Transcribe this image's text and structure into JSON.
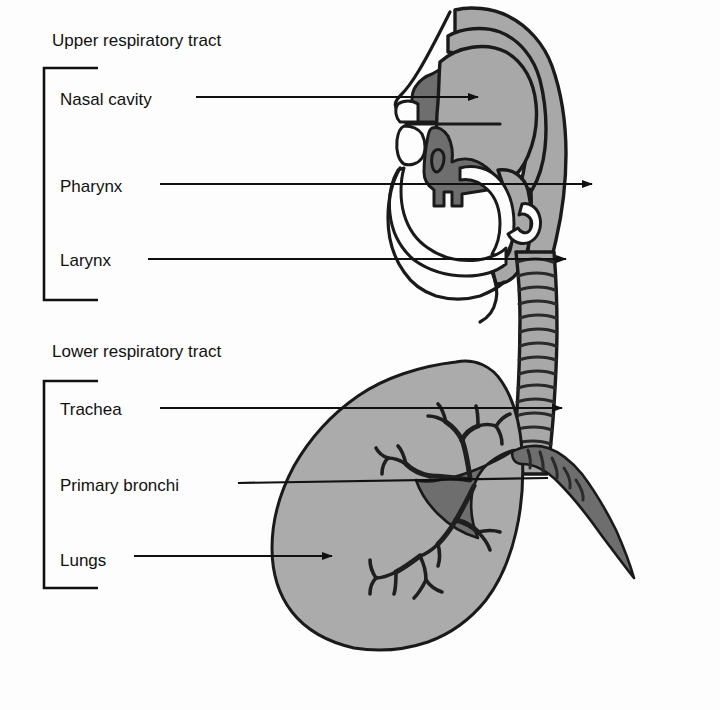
{
  "figure": {
    "background_color": "#fdfdfd",
    "ink_color": "#111111",
    "tissue_color": "#a8a8a8",
    "tissue_dark_color": "#6e6e6e",
    "lung_color": "#ababab"
  },
  "groups": [
    {
      "id": "upper",
      "title": "Upper respiratory tract",
      "labels": [
        {
          "id": "nasal-cavity",
          "text": "Nasal cavity"
        },
        {
          "id": "pharynx",
          "text": "Pharynx"
        },
        {
          "id": "larynx",
          "text": "Larynx"
        }
      ]
    },
    {
      "id": "lower",
      "title": "Lower respiratory tract",
      "labels": [
        {
          "id": "trachea",
          "text": "Trachea"
        },
        {
          "id": "primary-bronchi",
          "text": "Primary bronchi"
        },
        {
          "id": "lungs",
          "text": "Lungs"
        }
      ]
    }
  ],
  "structures": [
    {
      "id": "head-profile",
      "name": "head-sagittal-section"
    },
    {
      "id": "nasal-cavity-region",
      "name": "nasal-cavity"
    },
    {
      "id": "soft-palate",
      "name": "soft-palate"
    },
    {
      "id": "tongue",
      "name": "tongue"
    },
    {
      "id": "pharynx-region",
      "name": "pharynx"
    },
    {
      "id": "epiglottis",
      "name": "epiglottis"
    },
    {
      "id": "trachea-tube",
      "name": "trachea"
    },
    {
      "id": "left-primary-bronchus",
      "name": "primary-bronchus"
    },
    {
      "id": "right-primary-bronchus",
      "name": "primary-bronchus"
    },
    {
      "id": "lung",
      "name": "lung"
    },
    {
      "id": "bronchial-tree",
      "name": "bronchial-tree"
    }
  ]
}
